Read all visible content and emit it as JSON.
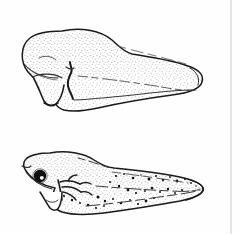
{
  "figure": {
    "kind": "scientific-line-illustration",
    "title": "Two amphibian larvae in lateral view",
    "background_color": "#fefefe",
    "ink_color": "#1a1a1a",
    "stipple_color": "#555555",
    "rule_color": "#c9c9c9",
    "canvas": {
      "width": 240,
      "height": 234
    },
    "page_rule": {
      "name": "vertical-margin-rule",
      "x": 231,
      "y_start": 0,
      "y_end": 234,
      "color": "#c9c9c9",
      "width_px": 1
    },
    "specimens": [
      {
        "id": "upper",
        "label": "upper-larva",
        "description": "Early larva, lateral view; rounded cranial mass, prominent ventral yolk-sac / adhesive-organ projection, eye not pigmented, long tapering tail with rounded tip.",
        "orientation": "head-left-tail-right",
        "bbox": {
          "x": 18,
          "y": 28,
          "width": 187,
          "height": 84
        },
        "features": [
          "rounded-head",
          "ventral-projection",
          "gill-notch",
          "dorsal-fin-fold",
          "tail-fin",
          "stippled-shading"
        ],
        "eye_pigmented": false
      },
      {
        "id": "lower",
        "label": "lower-larva",
        "description": "Later larva, lateral view; pigmented eye with highlight, branched external gills, dark dorsal melanophore speckling, pointed tail tip.",
        "orientation": "head-left-tail-right",
        "bbox": {
          "x": 18,
          "y": 150,
          "width": 187,
          "height": 68
        },
        "features": [
          "rounded-head",
          "pigmented-eye",
          "external-gills",
          "ventral-projection",
          "melanophore-speckles",
          "pointed-tail-tip",
          "stippled-shading"
        ],
        "eye_pigmented": true,
        "eye": {
          "cx": 40,
          "cy": 176,
          "r": 6.2,
          "fill": "#111111",
          "highlight_r": 1.9
        }
      }
    ],
    "text_labels": [],
    "axis_labels": [],
    "legend": []
  }
}
